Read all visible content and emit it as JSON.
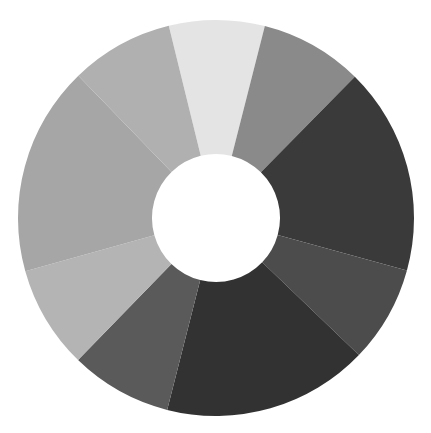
{
  "chart_data": {
    "type": "pie",
    "variant": "donut",
    "title": "",
    "legend": [],
    "center": {
      "x": 216,
      "y": 218
    },
    "outer_radius": 198,
    "inner_radius": 64,
    "start_angle_deg": -13.8,
    "direction": "clockwise",
    "slices": [
      {
        "label": "",
        "value": 7.8,
        "color": "#e4e4e4"
      },
      {
        "label": "",
        "value": 8.4,
        "color": "#8a8a8a"
      },
      {
        "label": "",
        "value": 16.9,
        "color": "#3a3a3a"
      },
      {
        "label": "",
        "value": 7.9,
        "color": "#4c4c4c"
      },
      {
        "label": "",
        "value": 16.8,
        "color": "#323232"
      },
      {
        "label": "",
        "value": 8.3,
        "color": "#5a5a5a"
      },
      {
        "label": "",
        "value": 8.4,
        "color": "#b4b4b4"
      },
      {
        "label": "",
        "value": 17.1,
        "color": "#a6a6a6"
      },
      {
        "label": "",
        "value": 8.4,
        "color": "#b0b0b0"
      }
    ],
    "values": [
      7.8,
      8.4,
      16.9,
      7.9,
      16.8,
      8.3,
      8.4,
      17.1,
      8.4
    ],
    "categories": [
      "",
      "",
      "",
      "",
      "",
      "",
      "",
      "",
      ""
    ]
  },
  "center_label": ""
}
